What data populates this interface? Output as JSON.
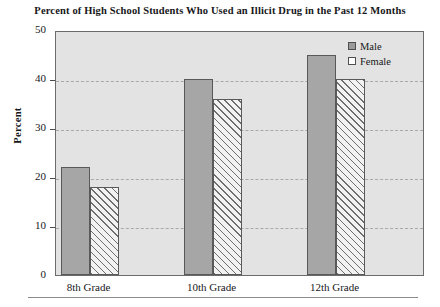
{
  "chart_data": {
    "type": "bar",
    "title": "Percent of High School Students Who Used an Illicit Drug in the Past 12 Months",
    "xlabel": "",
    "ylabel": "Percent",
    "categories": [
      "8th Grade",
      "10th Grade",
      "12th Grade"
    ],
    "series": [
      {
        "name": "Male",
        "values": [
          22,
          40,
          45
        ],
        "color": "#a6a6a6",
        "pattern": "solid"
      },
      {
        "name": "Female",
        "values": [
          18,
          36,
          40
        ],
        "color": "#f2f2f2",
        "pattern": "diagonal-hatch"
      }
    ],
    "ylim": [
      0,
      50
    ],
    "yticks": [
      0,
      10,
      20,
      30,
      40,
      50
    ],
    "ytick_labels": [
      "0",
      "10",
      "20",
      "30",
      "40",
      "50"
    ],
    "grid": true,
    "grid_style": "dashed-horizontal",
    "legend_position": "top-right",
    "plot_background": "#e3e3e3"
  },
  "legend": {
    "entries": [
      {
        "label": "Male"
      },
      {
        "label": "Female"
      }
    ]
  }
}
